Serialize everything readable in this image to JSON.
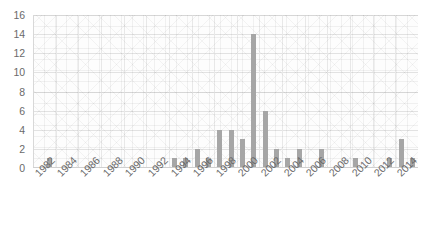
{
  "chart_data": {
    "type": "bar",
    "title": "",
    "subtitle": "",
    "xlabel": "",
    "ylabel": "",
    "categories": [
      "1982",
      "1983",
      "1984",
      "1985",
      "1986",
      "1987",
      "1988",
      "1989",
      "1990",
      "1991",
      "1992",
      "1993",
      "1994",
      "1995",
      "1996",
      "1997",
      "1998",
      "1999",
      "2000",
      "2001",
      "2002",
      "2003",
      "2004",
      "2005",
      "2006",
      "2007",
      "2008",
      "2009",
      "2010",
      "2011",
      "2012",
      "2013",
      "2014",
      "2015"
    ],
    "values": [
      0,
      1,
      0,
      0,
      0,
      0,
      0,
      0,
      0,
      0,
      0,
      0,
      1,
      1,
      2,
      1,
      4,
      4,
      3,
      14,
      6,
      2,
      1,
      2,
      0,
      2,
      0,
      0,
      1,
      0,
      0,
      1,
      3,
      1
    ],
    "xlim": [
      "1982",
      "2015"
    ],
    "ylim": [
      0,
      16
    ],
    "ytick_step": 2,
    "xtick_step": 2,
    "grid": true,
    "legend": "none",
    "bar_color": "#a6a6a6",
    "axis_text_color": "#6a6a6a",
    "gridline_color": "#e2e2e2",
    "plot_background": "#fdfdfd"
  },
  "axes": {
    "y_ticks": [
      "16",
      "14",
      "12",
      "10",
      "8",
      "6",
      "4",
      "2",
      "0"
    ],
    "y_tick_values": [
      16,
      14,
      12,
      10,
      8,
      6,
      4,
      2,
      0
    ],
    "x_ticks": [
      "1982",
      "1984",
      "1986",
      "1988",
      "1990",
      "1992",
      "1994",
      "1996",
      "1998",
      "2000",
      "2002",
      "2004",
      "2006",
      "2008",
      "2010",
      "2012",
      "2014"
    ],
    "x_tick_values": [
      1982,
      1984,
      1986,
      1988,
      1990,
      1992,
      1994,
      1996,
      1998,
      2000,
      2002,
      2004,
      2006,
      2008,
      2010,
      2012,
      2014
    ]
  }
}
